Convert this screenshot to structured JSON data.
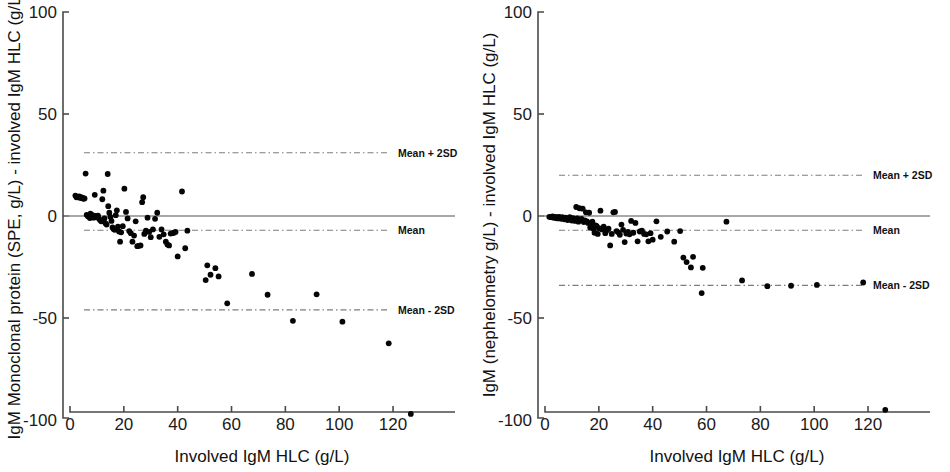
{
  "figure": {
    "background": "#ffffff",
    "point_color": "#050505",
    "axis_color": "#4a4a4a",
    "limit_line_color": "#7d7d7d",
    "zero_line_color": "#8a8a8a"
  },
  "chart_data": [
    {
      "panel": "left",
      "type": "scatter",
      "title": "",
      "xlabel": "Involved IgM HLC (g/L)",
      "ylabel": "IgM Monoclonal protein (SPE, g/L) - involved IgM HLC (g/L)",
      "xlim": [
        0,
        140
      ],
      "ylim": [
        -100,
        100
      ],
      "xticks": [
        0,
        20,
        40,
        60,
        80,
        100,
        120
      ],
      "yticks": [
        -100,
        -50,
        0,
        50,
        100
      ],
      "grid": false,
      "legend": "none",
      "reference_lines": [
        {
          "label": "Mean + 2SD",
          "value": 31,
          "style": "dash-dot"
        },
        {
          "label": "Mean",
          "value": -7,
          "style": "dash-dot"
        },
        {
          "label": "Mean - 2SD",
          "value": -46,
          "style": "dash-dot"
        },
        {
          "label": "zero",
          "value": 0,
          "style": "solid"
        }
      ],
      "x": [
        2.0,
        2.4,
        3.0,
        3.4,
        3.6,
        4.0,
        4.2,
        4.6,
        5.0,
        5.4,
        5.8,
        6.2,
        6.6,
        7.0,
        7.4,
        7.6,
        8.0,
        8.4,
        8.8,
        9.2,
        9.6,
        10.0,
        10.4,
        10.8,
        11.2,
        11.6,
        12.0,
        12.4,
        12.8,
        13.2,
        13.6,
        14.0,
        14.2,
        14.6,
        15.0,
        15.4,
        15.8,
        16.2,
        16.6,
        17.0,
        17.4,
        17.8,
        18.2,
        18.6,
        19.0,
        19.6,
        20.2,
        20.8,
        21.4,
        22.0,
        22.6,
        23.2,
        23.8,
        24.4,
        25.0,
        25.6,
        26.2,
        26.8,
        27.2,
        27.6,
        28.2,
        28.8,
        29.4,
        30.0,
        30.8,
        31.6,
        32.4,
        33.2,
        34.0,
        34.8,
        35.6,
        36.2,
        36.8,
        37.4,
        38.0,
        38.6,
        39.2,
        40.0,
        41.6,
        42.8,
        43.6,
        50.4,
        51.0,
        52.2,
        54.0,
        55.2,
        58.4,
        67.6,
        73.4,
        82.8,
        91.6,
        101.2,
        118.4,
        126.6
      ],
      "y": [
        10.0,
        9.2,
        9.4,
        9.6,
        9.0,
        9.2,
        8.8,
        9.0,
        8.4,
        8.6,
        20.8,
        0.6,
        0.0,
        -0.4,
        -1.0,
        1.2,
        -0.6,
        0.4,
        -0.8,
        10.4,
        0.0,
        -0.6,
        0.2,
        -1.4,
        -2.0,
        -2.6,
        8.2,
        12.4,
        -1.2,
        -3.6,
        -4.2,
        20.6,
        4.8,
        1.6,
        -0.4,
        -2.4,
        -5.6,
        -6.4,
        -6.8,
        0.4,
        2.8,
        -5.2,
        -7.6,
        -12.6,
        -8.0,
        -5.0,
        13.4,
        2.0,
        -1.2,
        -7.4,
        -8.4,
        -12.6,
        -9.6,
        -2.6,
        -14.8,
        -14.6,
        -14.4,
        6.8,
        9.2,
        -8.8,
        -7.2,
        -0.8,
        -7.8,
        -10.4,
        -6.6,
        -1.4,
        1.6,
        -10.2,
        -6.6,
        -9.0,
        -12.6,
        -14.0,
        -14.4,
        -8.6,
        -8.4,
        -8.2,
        -7.8,
        -19.8,
        12.0,
        -15.8,
        -7.2,
        -31.4,
        -24.2,
        -28.8,
        -25.6,
        -29.6,
        -42.8,
        -28.4,
        -38.6,
        -51.4,
        -38.4,
        -51.8,
        -62.4,
        -97.0
      ]
    },
    {
      "panel": "right",
      "type": "scatter",
      "title": "",
      "xlabel": "Involved IgM HLC (g/L)",
      "ylabel": "IgM (nephelometry g/L) - involved IgM HLC (g/L)",
      "xlim": [
        0,
        140
      ],
      "ylim": [
        -100,
        100
      ],
      "xticks": [
        0,
        20,
        40,
        60,
        80,
        100,
        120
      ],
      "yticks": [
        -100,
        -50,
        0,
        50,
        100
      ],
      "grid": false,
      "legend": "none",
      "reference_lines": [
        {
          "label": "Mean + 2SD",
          "value": 20,
          "style": "dash-dot"
        },
        {
          "label": "Mean",
          "value": -7,
          "style": "dash-dot"
        },
        {
          "label": "Mean - 2SD",
          "value": -34,
          "style": "dash-dot"
        },
        {
          "label": "zero",
          "value": 0,
          "style": "solid"
        }
      ],
      "x": [
        1.6,
        2.2,
        2.8,
        3.2,
        3.6,
        4.0,
        4.4,
        4.8,
        5.2,
        5.6,
        6.0,
        6.4,
        6.8,
        7.2,
        7.6,
        8.0,
        8.4,
        8.8,
        9.2,
        9.6,
        10.0,
        10.4,
        10.8,
        11.2,
        11.6,
        12.0,
        12.4,
        12.8,
        13.2,
        13.6,
        14.0,
        14.4,
        14.8,
        15.2,
        15.6,
        16.0,
        16.4,
        16.8,
        17.2,
        17.6,
        18.0,
        18.4,
        18.8,
        19.2,
        19.6,
        20.0,
        20.6,
        21.2,
        21.8,
        22.4,
        23.0,
        23.6,
        24.2,
        24.8,
        25.4,
        26.0,
        26.6,
        27.2,
        27.8,
        28.4,
        29.0,
        29.6,
        30.2,
        30.8,
        31.4,
        32.0,
        32.8,
        33.6,
        34.4,
        35.2,
        36.0,
        36.8,
        37.6,
        38.4,
        39.2,
        40.0,
        41.4,
        43.0,
        45.4,
        48.0,
        50.2,
        51.4,
        52.6,
        54.2,
        55.0,
        58.2,
        58.6,
        67.4,
        73.2,
        82.6,
        91.4,
        101.0,
        118.2,
        126.4
      ],
      "y": [
        -0.4,
        -0.6,
        -0.2,
        -0.8,
        -0.4,
        -1.0,
        -0.6,
        -1.2,
        -0.4,
        -0.8,
        -1.4,
        -0.6,
        -1.0,
        -1.6,
        -0.8,
        -1.2,
        -2.0,
        -1.4,
        -0.6,
        -1.8,
        -2.2,
        -1.0,
        -1.6,
        -2.4,
        4.4,
        -1.2,
        -2.8,
        3.8,
        -2.0,
        -1.4,
        3.6,
        -3.0,
        -2.2,
        1.8,
        -2.6,
        -3.4,
        1.6,
        -5.6,
        -3.8,
        -2.8,
        -6.2,
        -8.2,
        -4.6,
        -5.0,
        -8.8,
        -6.0,
        2.6,
        -6.6,
        -5.2,
        -8.4,
        -7.0,
        -6.2,
        -14.4,
        -8.8,
        1.8,
        2.0,
        -7.4,
        -8.0,
        -9.2,
        -4.2,
        -6.8,
        -12.8,
        -8.6,
        -7.8,
        -9.0,
        -2.4,
        -8.2,
        -3.4,
        -12.4,
        -7.6,
        -7.2,
        -8.8,
        -9.0,
        -12.4,
        -8.4,
        -11.6,
        -2.6,
        -10.2,
        -7.6,
        -12.6,
        -7.4,
        -20.4,
        -22.6,
        -25.2,
        -20.0,
        -37.8,
        -25.4,
        -2.8,
        -31.6,
        -34.4,
        -34.2,
        -33.8,
        -32.6,
        -95.0
      ]
    }
  ],
  "panels": {
    "left": {
      "name": "IgM Monoclonal protein SPE Bland-Altman",
      "y_axis_title": "IgM Monoclonal protein (SPE, g/L) - involved IgM HLC (g/L)",
      "x_axis_title": "Involved IgM HLC (g/L)",
      "x_tick_labels": [
        "0",
        "20",
        "40",
        "60",
        "80",
        "100",
        "120"
      ],
      "y_tick_labels": [
        "100",
        "50",
        "0",
        "-50",
        "-100"
      ],
      "limit_labels": {
        "upper": "Mean + 2SD",
        "mean": "Mean",
        "lower": "Mean - 2SD"
      }
    },
    "right": {
      "name": "IgM nephelometry Bland-Altman",
      "y_axis_title": "IgM (nephelometry g/L) - involved IgM HLC (g/L)",
      "x_axis_title": "Involved IgM HLC (g/L)",
      "x_tick_labels": [
        "0",
        "20",
        "40",
        "60",
        "80",
        "100",
        "120"
      ],
      "y_tick_labels": [
        "100",
        "50",
        "0",
        "-50",
        "-100"
      ],
      "limit_labels": {
        "upper": "Mean + 2SD",
        "mean": "Mean",
        "lower": "Mean - 2SD"
      }
    }
  }
}
